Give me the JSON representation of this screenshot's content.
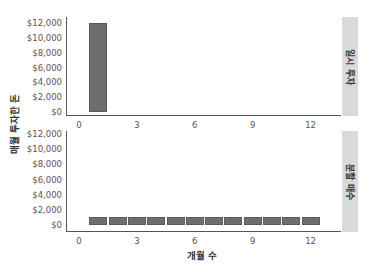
{
  "chart_data": {
    "type": "bar",
    "facet": "rows",
    "xlabel": "개월 수",
    "ylabel": "매월 투자한 돈",
    "x_ticks": [
      "0",
      "3",
      "6",
      "9",
      "12"
    ],
    "y_ticks": [
      "$0",
      "$2,000",
      "$4,000",
      "$6,000",
      "$8,000",
      "$10,000",
      "$12,000"
    ],
    "ylim": [
      0,
      12000
    ],
    "xlim": [
      0,
      13
    ],
    "grid": false,
    "panels": [
      {
        "strip_label": "일시 투자",
        "x": [
          1
        ],
        "values": [
          12000
        ]
      },
      {
        "strip_label": "분할 매수",
        "x": [
          1,
          2,
          3,
          4,
          5,
          6,
          7,
          8,
          9,
          10,
          11,
          12
        ],
        "values": [
          1000,
          1000,
          1000,
          1000,
          1000,
          1000,
          1000,
          1000,
          1000,
          1000,
          1000,
          1000
        ]
      }
    ],
    "colors": {
      "bar": "#6e6e6e",
      "strip": "#d9d9d9",
      "axis": "#555555"
    }
  }
}
